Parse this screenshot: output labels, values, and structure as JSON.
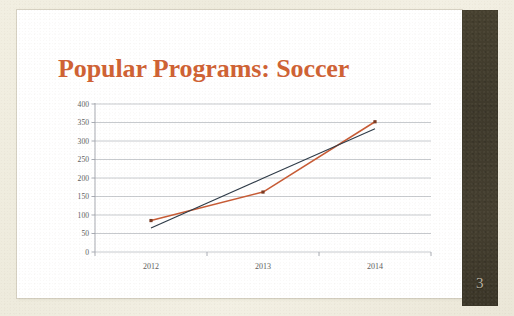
{
  "slide": {
    "title": "Popular Programs: Soccer",
    "page_number": "3",
    "title_color": "#cf6234",
    "sidebar_color": "#413b2c",
    "background_color": "#efece0",
    "slide_color": "#ffffff"
  },
  "chart_data": {
    "type": "line",
    "title": "Popular Programs: Soccer",
    "xlabel": "",
    "ylabel": "",
    "categories": [
      "2012",
      "2013",
      "2014"
    ],
    "x": [
      "2012",
      "2013",
      "2014"
    ],
    "ylim": [
      0,
      400
    ],
    "ytick_labels": [
      "0",
      "50",
      "100",
      "150",
      "200",
      "250",
      "300",
      "350",
      "400"
    ],
    "ytick_values": [
      0,
      50,
      100,
      150,
      200,
      250,
      300,
      350,
      400
    ],
    "grid": true,
    "grid_axis": "y",
    "legend": false,
    "legend_position": "none",
    "series": [
      {
        "name": "Soccer",
        "kind": "data",
        "color": "#c75b35",
        "marker": "square",
        "marker_color": "#7a3a22",
        "values": [
          85,
          162,
          352
        ]
      },
      {
        "name": "Linear Trendline",
        "kind": "trendline",
        "color": "#2d3a47",
        "marker": "none",
        "values": [
          65,
          199,
          333
        ]
      }
    ]
  }
}
